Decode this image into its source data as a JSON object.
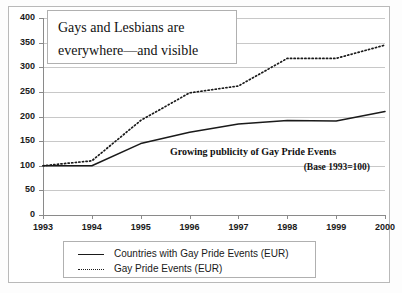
{
  "chart_data": {
    "type": "line",
    "title": "Gays and Lesbians are everywhere—and visible",
    "title_lines": [
      "Gays and Lesbians are",
      "everywhere—and visible"
    ],
    "subtitle": "Growing publicity of Gay Pride Events",
    "subtitle_note": "(Base 1993=100)",
    "xlabel": "",
    "ylabel": "",
    "x": [
      1993,
      1994,
      1995,
      1996,
      1997,
      1998,
      1999,
      2000
    ],
    "categories": [
      "1993",
      "1994",
      "1995",
      "1996",
      "1997",
      "1998",
      "1999",
      "2000"
    ],
    "ylim": [
      0,
      400
    ],
    "yticks": [
      0,
      50,
      100,
      150,
      200,
      250,
      300,
      350,
      400
    ],
    "ytick_labels": [
      "0",
      "50",
      "100",
      "150",
      "200",
      "250",
      "300",
      "350",
      "400"
    ],
    "grid": true,
    "legend_position": "bottom",
    "series": [
      {
        "name": "Countries with Gay Pride Events (EUR)",
        "style": "solid",
        "color": "#1a1a1a",
        "values": [
          100,
          100,
          145,
          168,
          185,
          192,
          191,
          210
        ]
      },
      {
        "name": "Gay Pride Events (EUR)",
        "style": "dotted",
        "color": "#1a1a1a",
        "values": [
          100,
          110,
          192,
          248,
          262,
          318,
          318,
          345
        ]
      }
    ]
  },
  "legend": {
    "items": [
      {
        "label": "Countries with Gay Pride Events (EUR)",
        "style": "solid"
      },
      {
        "label": "Gay Pride Events (EUR)",
        "style": "dotted"
      }
    ]
  }
}
